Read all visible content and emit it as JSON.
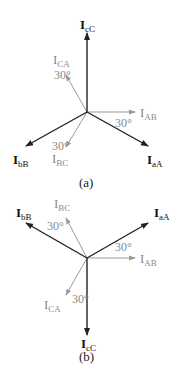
{
  "colors": {
    "line_current": "#222222",
    "phase_current": "#9a9a9a",
    "label_line": "#111111",
    "label_phase": "#8a8a8a",
    "background": "#ffffff"
  },
  "diagram_a": {
    "caption": "(a)",
    "center": [
      87,
      112
    ],
    "line_currents": [
      {
        "main": "I",
        "sub": "cC",
        "tip": [
          87,
          33
        ]
      },
      {
        "main": "I",
        "sub": "aA",
        "tip": [
          148,
          146
        ]
      },
      {
        "main": "I",
        "sub": "bB",
        "tip": [
          26,
          146
        ]
      }
    ],
    "phase_currents": [
      {
        "main": "I",
        "sub": "CA",
        "tip": [
          66,
          75
        ]
      },
      {
        "main": "I",
        "sub": "AB",
        "tip": [
          135,
          112
        ]
      },
      {
        "main": "I",
        "sub": "BC",
        "tip": [
          66,
          147
        ]
      }
    ],
    "angles": [
      "30°",
      "30°",
      "30°"
    ]
  },
  "diagram_b": {
    "caption": "(b)",
    "center": [
      87,
      258
    ],
    "line_currents": [
      {
        "main": "I",
        "sub": "bB",
        "tip": [
          26,
          223
        ]
      },
      {
        "main": "I",
        "sub": "aA",
        "tip": [
          148,
          223
        ]
      },
      {
        "main": "I",
        "sub": "cC",
        "tip": [
          87,
          335
        ]
      }
    ],
    "phase_currents": [
      {
        "main": "I",
        "sub": "BC",
        "tip": [
          66,
          218
        ]
      },
      {
        "main": "I",
        "sub": "AB",
        "tip": [
          135,
          258
        ]
      },
      {
        "main": "I",
        "sub": "CA",
        "tip": [
          66,
          295
        ]
      }
    ],
    "angles": [
      "30°",
      "30°",
      "30°"
    ]
  }
}
